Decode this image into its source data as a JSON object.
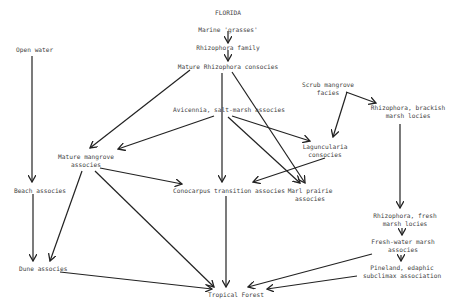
{
  "title": "FLORIDA",
  "nodes": {
    "marine_grasses": {
      "label": "Marine 'grasses'",
      "x": 228,
      "y": 26
    },
    "rhizophora_family": {
      "label": "Rhizophora family",
      "x": 228,
      "y": 45
    },
    "mature_rhizophora": {
      "label": "Mature Rhizophora consocies",
      "x": 228,
      "y": 63
    },
    "open_water": {
      "label": "Open water",
      "x": 32,
      "y": 49
    },
    "scrub_mangrove": {
      "label": "Scrub mangrove\nfacies",
      "x": 340,
      "y": 80
    },
    "rhizophora_brackish": {
      "label": "Rhizophora, brackish\nmarsh locies",
      "x": 407,
      "y": 107
    },
    "avicennia": {
      "label": "Avicennia, salt-marsh associes",
      "x": 250,
      "y": 108
    },
    "laguncularia": {
      "label": "Laguncularia\nconsocies",
      "x": 340,
      "y": 143
    },
    "mature_mangrove": {
      "label": "Mature mangrove\nassocies",
      "x": 85,
      "y": 153
    },
    "beach": {
      "label": "Beach associes",
      "x": 40,
      "y": 187
    },
    "conocarpus": {
      "label": "Conocarpus transition associes",
      "x": 232,
      "y": 187
    },
    "marl_prairie": {
      "label": "Marl prairie\nassocies",
      "x": 310,
      "y": 187
    },
    "rhizophora_fresh": {
      "label": "Rhizophora, fresh\nmarsh locies",
      "x": 405,
      "y": 213
    },
    "fresh_water_marsh": {
      "label": "Fresh-water marsh\nassocies",
      "x": 403,
      "y": 239
    },
    "pineland": {
      "label": "Pineland, edaphic\nsubclimax association",
      "x": 400,
      "y": 264
    },
    "dune": {
      "label": "Dune associes",
      "x": 18,
      "y": 266
    },
    "tropical_forest": {
      "label": "Tropical Forest",
      "x": 235,
      "y": 292
    }
  },
  "edges": [
    {
      "from": "marine_grasses",
      "to": "rhizophora_family"
    },
    {
      "from": "rhizophora_family",
      "to": "mature_rhizophora"
    },
    {
      "from": "mature_rhizophora",
      "to": "mature_mangrove"
    },
    {
      "from": "mature_rhizophora",
      "to": "conocarpus"
    },
    {
      "from": "mature_rhizophora",
      "to": "marl_prairie"
    },
    {
      "from": "avicennia",
      "to": "mature_mangrove"
    },
    {
      "from": "avicennia",
      "to": "laguncularia"
    },
    {
      "from": "avicennia",
      "to": "marl_prairie"
    },
    {
      "from": "scrub_mangrove",
      "to": "laguncularia"
    },
    {
      "from": "scrub_mangrove",
      "to": "rhizophora_brackish"
    },
    {
      "from": "laguncularia",
      "to": "conocarpus"
    },
    {
      "from": "mature_mangrove",
      "to": "conocarpus"
    },
    {
      "from": "mature_mangrove",
      "to": "dune"
    },
    {
      "from": "mature_mangrove",
      "to": "tropical_forest"
    },
    {
      "from": "open_water",
      "to": "beach"
    },
    {
      "from": "beach",
      "to": "dune"
    },
    {
      "from": "dune",
      "to": "tropical_forest"
    },
    {
      "from": "conocarpus",
      "to": "tropical_forest"
    },
    {
      "from": "rhizophora_brackish",
      "to": "rhizophora_fresh"
    },
    {
      "from": "rhizophora_fresh",
      "to": "fresh_water_marsh"
    },
    {
      "from": "fresh_water_marsh",
      "to": "pineland"
    },
    {
      "from": "fresh_water_marsh",
      "to": "tropical_forest"
    },
    {
      "from": "pineland",
      "to": "tropical_forest"
    }
  ]
}
